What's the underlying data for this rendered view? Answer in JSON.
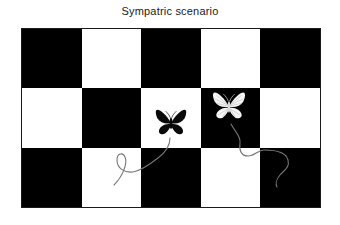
{
  "title": "Sympatric scenario",
  "colors": {
    "background": "#ffffff",
    "square_black": "#000000",
    "square_white": "#ffffff",
    "board_border": "#1a1a1a",
    "path_stroke": "#777777",
    "butterfly_black": "#0a0a0a",
    "butterfly_white": "#f6f6f6",
    "title_color": "#1a1a1a"
  },
  "board": {
    "rows": 3,
    "cols": 5,
    "pattern": [
      [
        "black",
        "white",
        "black",
        "white",
        "black"
      ],
      [
        "white",
        "black",
        "white",
        "black",
        "white"
      ],
      [
        "black",
        "white",
        "black",
        "white",
        "black"
      ]
    ]
  },
  "butterflies": [
    {
      "name": "black-morph",
      "wing_color": "black",
      "row": 2,
      "col": 3,
      "background_square": "white"
    },
    {
      "name": "white-morph",
      "wing_color": "white",
      "row": 2,
      "col": 4,
      "background_square": "black"
    }
  ],
  "flight_paths": [
    {
      "belongs_to": "black-morph",
      "direction": "curls down-left into lower-left squares"
    },
    {
      "belongs_to": "white-morph",
      "direction": "curls down-right into lower-right squares"
    }
  ]
}
